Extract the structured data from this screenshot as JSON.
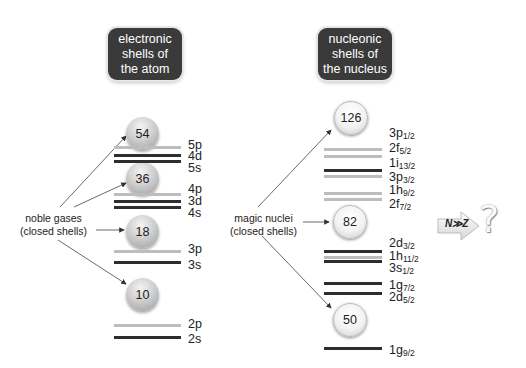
{
  "left_panel": {
    "title_lines": [
      "electronic",
      "shells of",
      "the atom"
    ],
    "side_label_lines": [
      "noble gases",
      "(closed shells)"
    ],
    "magic_numbers": [
      "54",
      "36",
      "18",
      "10"
    ],
    "levels": [
      {
        "name": "5p",
        "sub": "",
        "shade": "light"
      },
      {
        "name": "4d",
        "sub": "",
        "shade": "dark"
      },
      {
        "name": "5s",
        "sub": "",
        "shade": "dark"
      },
      {
        "name": "4p",
        "sub": "",
        "shade": "light"
      },
      {
        "name": "3d",
        "sub": "",
        "shade": "dark"
      },
      {
        "name": "4s",
        "sub": "",
        "shade": "dark"
      },
      {
        "name": "3p",
        "sub": "",
        "shade": "light"
      },
      {
        "name": "3s",
        "sub": "",
        "shade": "dark"
      },
      {
        "name": "2p",
        "sub": "",
        "shade": "light"
      },
      {
        "name": "2s",
        "sub": "",
        "shade": "dark"
      }
    ]
  },
  "right_panel": {
    "title_lines": [
      "nucleonic",
      "shells of",
      "the nucleus"
    ],
    "side_label_lines": [
      "magic nuclei",
      "(closed shells)"
    ],
    "magic_numbers": [
      "126",
      "82",
      "50"
    ],
    "levels": [
      {
        "name": "3p",
        "sub": "1/2",
        "shade": "light"
      },
      {
        "name": "2f",
        "sub": "5/2",
        "shade": "light"
      },
      {
        "name": "1i",
        "sub": "13/2",
        "shade": "dark"
      },
      {
        "name": "3p",
        "sub": "3/2",
        "shade": "light"
      },
      {
        "name": "1h",
        "sub": "9/2",
        "shade": "light"
      },
      {
        "name": "2f",
        "sub": "7/2",
        "shade": "light"
      },
      {
        "name": "2d",
        "sub": "3/2",
        "shade": "dark"
      },
      {
        "name": "1h",
        "sub": "11/2",
        "shade": "light"
      },
      {
        "name": "3s",
        "sub": "1/2",
        "shade": "dark"
      },
      {
        "name": "1g",
        "sub": "7/2",
        "shade": "dark"
      },
      {
        "name": "2d",
        "sub": "5/2",
        "shade": "dark"
      },
      {
        "name": "1g",
        "sub": "9/2",
        "shade": "dark"
      }
    ]
  },
  "annotation": {
    "arrow_text": "N≫Z",
    "question_mark": "?"
  },
  "colors": {
    "title_box": "#3a3a3a",
    "dark_level": "#2e2e2e",
    "light_level": "#bdbdbd"
  }
}
